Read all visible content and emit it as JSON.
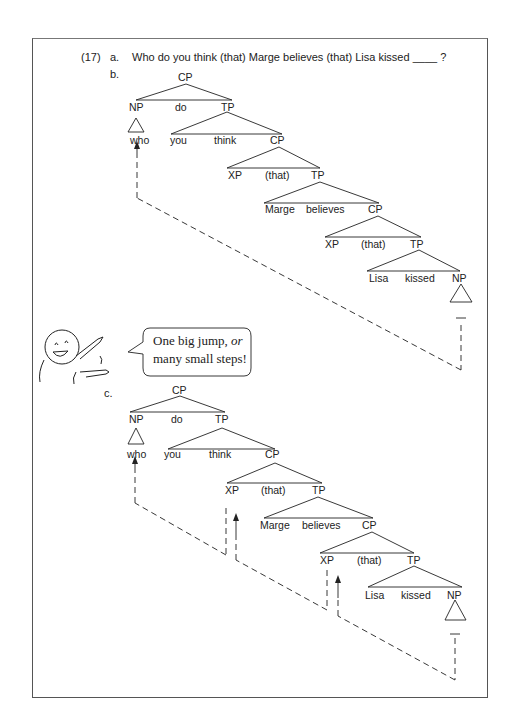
{
  "example": {
    "number": "(17)",
    "a_label": "a.",
    "sentence_pre": "Who do you think (that) Marge believes (that) Lisa kissed",
    "sentence_gap": "____",
    "sentence_end": "?",
    "b_label": "b.",
    "c_label": "c."
  },
  "tree_b": {
    "nodes": {
      "cp1": "CP",
      "np_who": "NP",
      "do": "do",
      "tp1": "TP",
      "who": "who",
      "you": "you",
      "think": "think",
      "cp2": "CP",
      "xp1": "XP",
      "that1": "(that)",
      "tp2": "TP",
      "marge": "Marge",
      "believes": "believes",
      "cp3": "CP",
      "xp2": "XP",
      "that2": "(that)",
      "tp3": "TP",
      "lisa": "Lisa",
      "kissed": "kissed",
      "np_obj": "NP",
      "gap": "—"
    },
    "movement": "one big jump"
  },
  "tree_c": {
    "nodes": {
      "cp1": "CP",
      "np_who": "NP",
      "do": "do",
      "tp1": "TP",
      "who": "who",
      "you": "you",
      "think": "think",
      "cp2": "CP",
      "xp1": "XP",
      "that1": "(that)",
      "tp2": "TP",
      "marge": "Marge",
      "believes": "believes",
      "cp3": "CP",
      "xp2": "XP",
      "that2": "(that)",
      "tp3": "TP",
      "lisa": "Lisa",
      "kissed": "kissed",
      "np_obj": "NP",
      "gap": "—"
    },
    "movement": "many small steps"
  },
  "bubble": {
    "line1_pre": "One big jump, ",
    "line1_em": "or",
    "line2": "many small steps!"
  }
}
